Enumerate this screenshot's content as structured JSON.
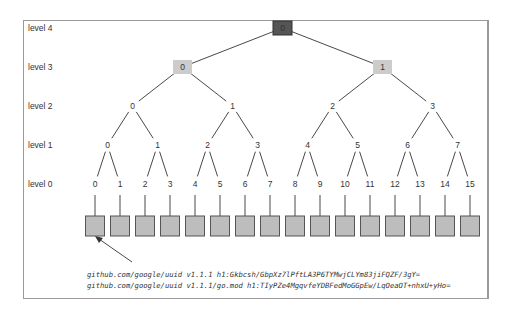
{
  "diagram": {
    "level_labels": [
      "level 4",
      "level 3",
      "level 2",
      "level 1",
      "level 0"
    ],
    "levels": {
      "level4": [
        "0"
      ],
      "level3": [
        "0",
        "1"
      ],
      "level2": [
        "0",
        "1",
        "2",
        "3"
      ],
      "level1": [
        "0",
        "1",
        "2",
        "3",
        "4",
        "5",
        "6",
        "7"
      ],
      "level0": [
        "0",
        "1",
        "2",
        "3",
        "4",
        "5",
        "6",
        "7",
        "8",
        "9",
        "10",
        "11",
        "12",
        "13",
        "14",
        "15"
      ]
    },
    "root_color": "#555555",
    "level3_color": "#cccccc",
    "leaf_color": "#bdbdbd",
    "leaf_count": 16,
    "annotation_lines": [
      "github.com/google/uuid v1.1.1 h1:Gkbcsh/GbpXz7lPftLA3P6TYMwjCLYm83jiFQZF/3gY=",
      "github.com/google/uuid v1.1.1/go.mod h1:TIyPZe4MgqvfeYDBFedMoGGpEw/LqOeaOT+nhxU+yHo="
    ],
    "arrow_target": "leaf 0"
  }
}
